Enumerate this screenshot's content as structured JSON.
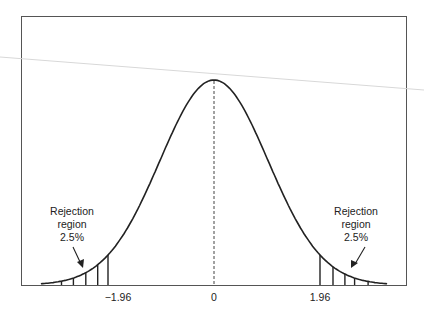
{
  "chart_data": {
    "type": "area",
    "title": "",
    "xlabel": "",
    "ylabel": "",
    "x_ticks": [
      "-1.96",
      "0",
      "1.96"
    ],
    "xlim": [
      -3.2,
      3.2
    ],
    "grid": false,
    "series": [
      {
        "name": "Normal density curve",
        "mean": 0,
        "sd": 1
      }
    ],
    "center_line": {
      "x": 0,
      "style": "dashed"
    },
    "shaded_regions": [
      {
        "from": -3.2,
        "to": -1.96,
        "style": "vertical hatching",
        "label": "Rejection region 2.5%"
      },
      {
        "from": 1.96,
        "to": 3.2,
        "style": "vertical hatching",
        "label": "Rejection region 2.5%"
      }
    ],
    "annotations": [
      {
        "text": [
          "Rejection",
          "region",
          "2.5%"
        ],
        "side": "left",
        "arrow": true
      },
      {
        "text": [
          "Rejection",
          "region",
          "2.5%"
        ],
        "side": "right",
        "arrow": true
      }
    ]
  },
  "labels": {
    "tick_left": "−1.96",
    "tick_center": "0",
    "tick_right": "1.96",
    "left_annotation": {
      "line1": "Rejection",
      "line2": "region",
      "line3": "2.5%"
    },
    "right_annotation": {
      "line1": "Rejection",
      "line2": "region",
      "line3": "2.5%"
    }
  }
}
